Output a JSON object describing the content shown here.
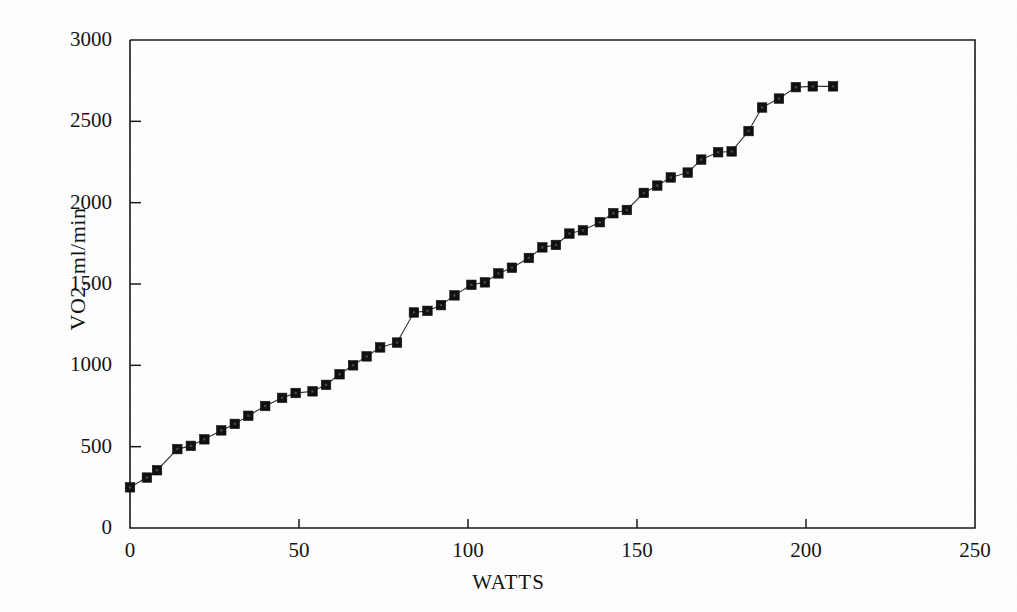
{
  "chart_data": {
    "type": "scatter",
    "title": "",
    "xlabel": "WATTS",
    "ylabel": "VO2, ml/min",
    "xlim": [
      0,
      250
    ],
    "ylim": [
      0,
      3000
    ],
    "xticks": [
      0,
      50,
      100,
      150,
      200,
      250
    ],
    "yticks": [
      0,
      500,
      1000,
      1500,
      2000,
      2500,
      3000
    ],
    "xtick_labels": [
      "0",
      "50",
      "100",
      "150",
      "200",
      "250"
    ],
    "ytick_labels": [
      "0",
      "500",
      "1000",
      "1500",
      "2000",
      "2500",
      "3000"
    ],
    "grid": false,
    "legend": null,
    "marker": "filled-square",
    "marker_color": "#111111",
    "line_color": "#333333",
    "line_style": "thin-solid",
    "series": [
      {
        "name": "VO2",
        "x": [
          0,
          5,
          8,
          14,
          18,
          22,
          27,
          31,
          35,
          40,
          45,
          49,
          54,
          58,
          62,
          66,
          70,
          74,
          79,
          84,
          88,
          92,
          96,
          101,
          105,
          109,
          113,
          118,
          122,
          126,
          130,
          134,
          139,
          143,
          147,
          152,
          156,
          160,
          165,
          169,
          174,
          178,
          183,
          187,
          192,
          197,
          202,
          208
        ],
        "y": [
          250,
          310,
          355,
          485,
          505,
          545,
          600,
          640,
          690,
          750,
          800,
          830,
          840,
          880,
          945,
          1000,
          1055,
          1110,
          1140,
          1325,
          1335,
          1370,
          1430,
          1495,
          1510,
          1565,
          1600,
          1660,
          1725,
          1740,
          1810,
          1830,
          1880,
          1935,
          1955,
          2060,
          2105,
          2155,
          2185,
          2265,
          2310,
          2315,
          2440,
          2585,
          2640,
          2710,
          2715,
          2715
        ]
      }
    ]
  },
  "axis": {
    "frame": true,
    "tick_direction": "in"
  }
}
